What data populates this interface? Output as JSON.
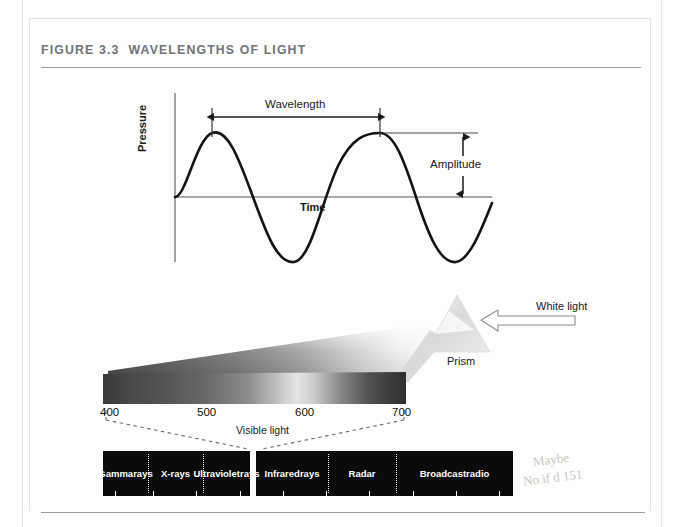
{
  "figure": {
    "number": "FIGURE 3.3",
    "title": "WAVELENGTHS OF LIGHT"
  },
  "wave_diagram": {
    "y_axis_label": "Pressure",
    "x_axis_label": "Time",
    "wavelength_label": "Wavelength",
    "amplitude_label": "Amplitude"
  },
  "prism_diagram": {
    "white_light_label": "White light",
    "prism_label": "Prism",
    "visible_light_label": "Visible light",
    "wavelength_ticks": [
      "400",
      "500",
      "600",
      "700"
    ]
  },
  "em_spectrum": {
    "bands_left": [
      {
        "label": "Gamma\nrays"
      },
      {
        "label": "X-rays"
      },
      {
        "label": "Ultraviolet\nrays"
      }
    ],
    "bands_right": [
      {
        "label": "Infrared\nrays"
      },
      {
        "label": "Radar"
      },
      {
        "label": "Broadcast\nradio"
      }
    ]
  },
  "annotations": {
    "margin_note_line1": "Maybe",
    "margin_note_line2": "No if d 151"
  },
  "chart_data": {
    "type": "line",
    "title": "WAVELENGTHS OF LIGHT",
    "panels": [
      {
        "name": "sine-wave",
        "type": "line",
        "xlabel": "Time",
        "ylabel": "Pressure",
        "annotations": [
          "Wavelength",
          "Amplitude"
        ],
        "cycles": 2.5,
        "amplitude": 1.0,
        "grid": false
      },
      {
        "name": "visible-spectrum",
        "type": "bar",
        "xlabel": "Visible light",
        "categories": [
          "400",
          "500",
          "600",
          "700"
        ],
        "values": [
          400,
          500,
          600,
          700
        ],
        "xlim": [
          400,
          700
        ],
        "units": "nanometers"
      },
      {
        "name": "electromagnetic-spectrum",
        "type": "bar",
        "categories": [
          "Gamma rays",
          "X-rays",
          "Ultraviolet rays",
          "Visible light",
          "Infrared rays",
          "Radar",
          "Broadcast radio"
        ],
        "values": [
          1,
          1,
          1,
          0.1,
          1,
          1,
          1.4
        ],
        "grid": false
      }
    ]
  }
}
